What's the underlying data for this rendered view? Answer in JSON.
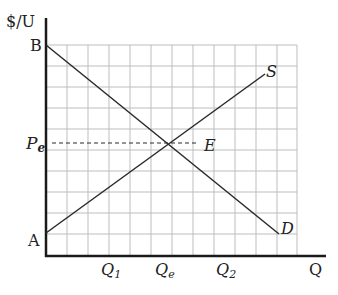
{
  "diagram": {
    "type": "supply-demand",
    "axes": {
      "y_label": "$/U",
      "x_label": "Q"
    },
    "points": {
      "B": "B",
      "A": "A",
      "E": "E",
      "Pe": "P",
      "Pe_sub": "e"
    },
    "curves": {
      "supply": "S",
      "demand": "D"
    },
    "x_ticks": {
      "q1": "Q",
      "q1_sub": "1",
      "qe": "Q",
      "qe_sub": "e",
      "q2": "Q",
      "q2_sub": "2"
    },
    "colors": {
      "axis": "#1a1a1a",
      "grid": "#b8b8b8",
      "curve": "#2a2a2a"
    }
  }
}
